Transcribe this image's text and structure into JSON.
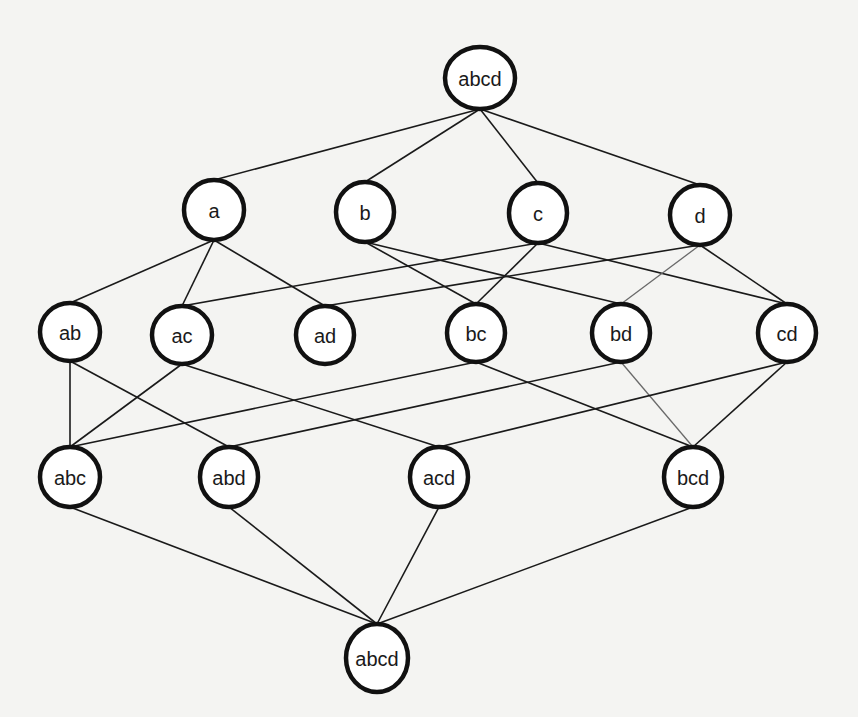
{
  "diagram": {
    "type": "lattice",
    "colors": {
      "background": "#f4f4f2",
      "node_stroke": "#111111",
      "node_fill": "#ffffff",
      "edge": "#1a1a1a"
    },
    "nodes": [
      {
        "id": "top",
        "label": "abcd",
        "x": 480,
        "y": 78,
        "rx": 35,
        "ry": 31
      },
      {
        "id": "a",
        "label": "a",
        "x": 214,
        "y": 210,
        "rx": 30,
        "ry": 30
      },
      {
        "id": "b",
        "label": "b",
        "x": 365,
        "y": 212,
        "rx": 29,
        "ry": 30
      },
      {
        "id": "c",
        "label": "c",
        "x": 538,
        "y": 213,
        "rx": 29,
        "ry": 30
      },
      {
        "id": "d",
        "label": "d",
        "x": 700,
        "y": 215,
        "rx": 30,
        "ry": 30
      },
      {
        "id": "ab",
        "label": "ab",
        "x": 70,
        "y": 332,
        "rx": 30,
        "ry": 29
      },
      {
        "id": "ac",
        "label": "ac",
        "x": 182,
        "y": 335,
        "rx": 30,
        "ry": 29
      },
      {
        "id": "ad",
        "label": "ad",
        "x": 325,
        "y": 335,
        "rx": 29,
        "ry": 29
      },
      {
        "id": "bc",
        "label": "bc",
        "x": 476,
        "y": 333,
        "rx": 29,
        "ry": 29
      },
      {
        "id": "bd",
        "label": "bd",
        "x": 621,
        "y": 333,
        "rx": 29,
        "ry": 29
      },
      {
        "id": "cd",
        "label": "cd",
        "x": 787,
        "y": 333,
        "rx": 29,
        "ry": 29
      },
      {
        "id": "abc",
        "label": "abc",
        "x": 70,
        "y": 477,
        "rx": 30,
        "ry": 30
      },
      {
        "id": "abd",
        "label": "abd",
        "x": 229,
        "y": 477,
        "rx": 29,
        "ry": 30
      },
      {
        "id": "acd",
        "label": "acd",
        "x": 439,
        "y": 477,
        "rx": 29,
        "ry": 30
      },
      {
        "id": "bcd",
        "label": "bcd",
        "x": 693,
        "y": 477,
        "rx": 29,
        "ry": 30
      },
      {
        "id": "bottom",
        "label": "abcd",
        "x": 377,
        "y": 658,
        "rx": 31,
        "ry": 34
      }
    ],
    "edges": [
      {
        "from": "top",
        "to": "a"
      },
      {
        "from": "top",
        "to": "b"
      },
      {
        "from": "top",
        "to": "c"
      },
      {
        "from": "top",
        "to": "d"
      },
      {
        "from": "a",
        "to": "ab"
      },
      {
        "from": "a",
        "to": "ac"
      },
      {
        "from": "a",
        "to": "ad"
      },
      {
        "from": "b",
        "to": "bc"
      },
      {
        "from": "b",
        "to": "bd"
      },
      {
        "from": "c",
        "to": "ac"
      },
      {
        "from": "c",
        "to": "bc"
      },
      {
        "from": "c",
        "to": "cd"
      },
      {
        "from": "d",
        "to": "ad"
      },
      {
        "from": "d",
        "to": "bd",
        "style": "light"
      },
      {
        "from": "d",
        "to": "cd"
      },
      {
        "from": "ab",
        "to": "abc"
      },
      {
        "from": "ab",
        "to": "abd"
      },
      {
        "from": "ac",
        "to": "abc"
      },
      {
        "from": "ac",
        "to": "acd"
      },
      {
        "from": "bc",
        "to": "abc"
      },
      {
        "from": "bc",
        "to": "bcd"
      },
      {
        "from": "bd",
        "to": "abd"
      },
      {
        "from": "bd",
        "to": "bcd",
        "style": "light"
      },
      {
        "from": "cd",
        "to": "acd"
      },
      {
        "from": "cd",
        "to": "bcd"
      },
      {
        "from": "abc",
        "to": "bottom"
      },
      {
        "from": "abd",
        "to": "bottom"
      },
      {
        "from": "acd",
        "to": "bottom"
      },
      {
        "from": "bcd",
        "to": "bottom"
      }
    ]
  }
}
